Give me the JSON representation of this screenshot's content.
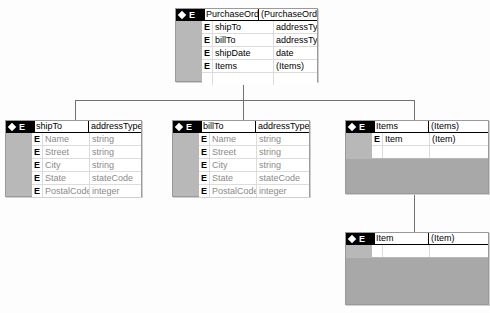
{
  "diagram": {
    "root": {
      "tag": "E",
      "name": "PurchaseOrder",
      "type": "(PurchaseOrder)",
      "children": [
        {
          "kind": "E",
          "name": "shipTo",
          "type": "addressType"
        },
        {
          "kind": "E",
          "name": "billTo",
          "type": "addressType"
        },
        {
          "kind": "E",
          "name": "shipDate",
          "type": "date"
        },
        {
          "kind": "E",
          "name": "Items",
          "type": "(Items)"
        }
      ]
    },
    "shipTo": {
      "tag": "E",
      "name": "shipTo",
      "type": "addressType",
      "children": [
        {
          "kind": "E",
          "name": "Name",
          "type": "string"
        },
        {
          "kind": "E",
          "name": "Street",
          "type": "string"
        },
        {
          "kind": "E",
          "name": "City",
          "type": "string"
        },
        {
          "kind": "E",
          "name": "State",
          "type": "stateCode"
        },
        {
          "kind": "E",
          "name": "PostalCode",
          "type": "integer"
        }
      ]
    },
    "billTo": {
      "tag": "E",
      "name": "billTo",
      "type": "addressType",
      "children": [
        {
          "kind": "E",
          "name": "Name",
          "type": "string"
        },
        {
          "kind": "E",
          "name": "Street",
          "type": "string"
        },
        {
          "kind": "E",
          "name": "City",
          "type": "string"
        },
        {
          "kind": "E",
          "name": "State",
          "type": "stateCode"
        },
        {
          "kind": "E",
          "name": "PostalCode",
          "type": "integer"
        }
      ]
    },
    "items": {
      "tag": "E",
      "name": "Items",
      "type": "(Items)",
      "children": [
        {
          "kind": "E",
          "name": "Item",
          "type": "(Item)"
        }
      ]
    },
    "item": {
      "tag": "E",
      "name": "Item",
      "type": "(Item)",
      "children": []
    }
  }
}
